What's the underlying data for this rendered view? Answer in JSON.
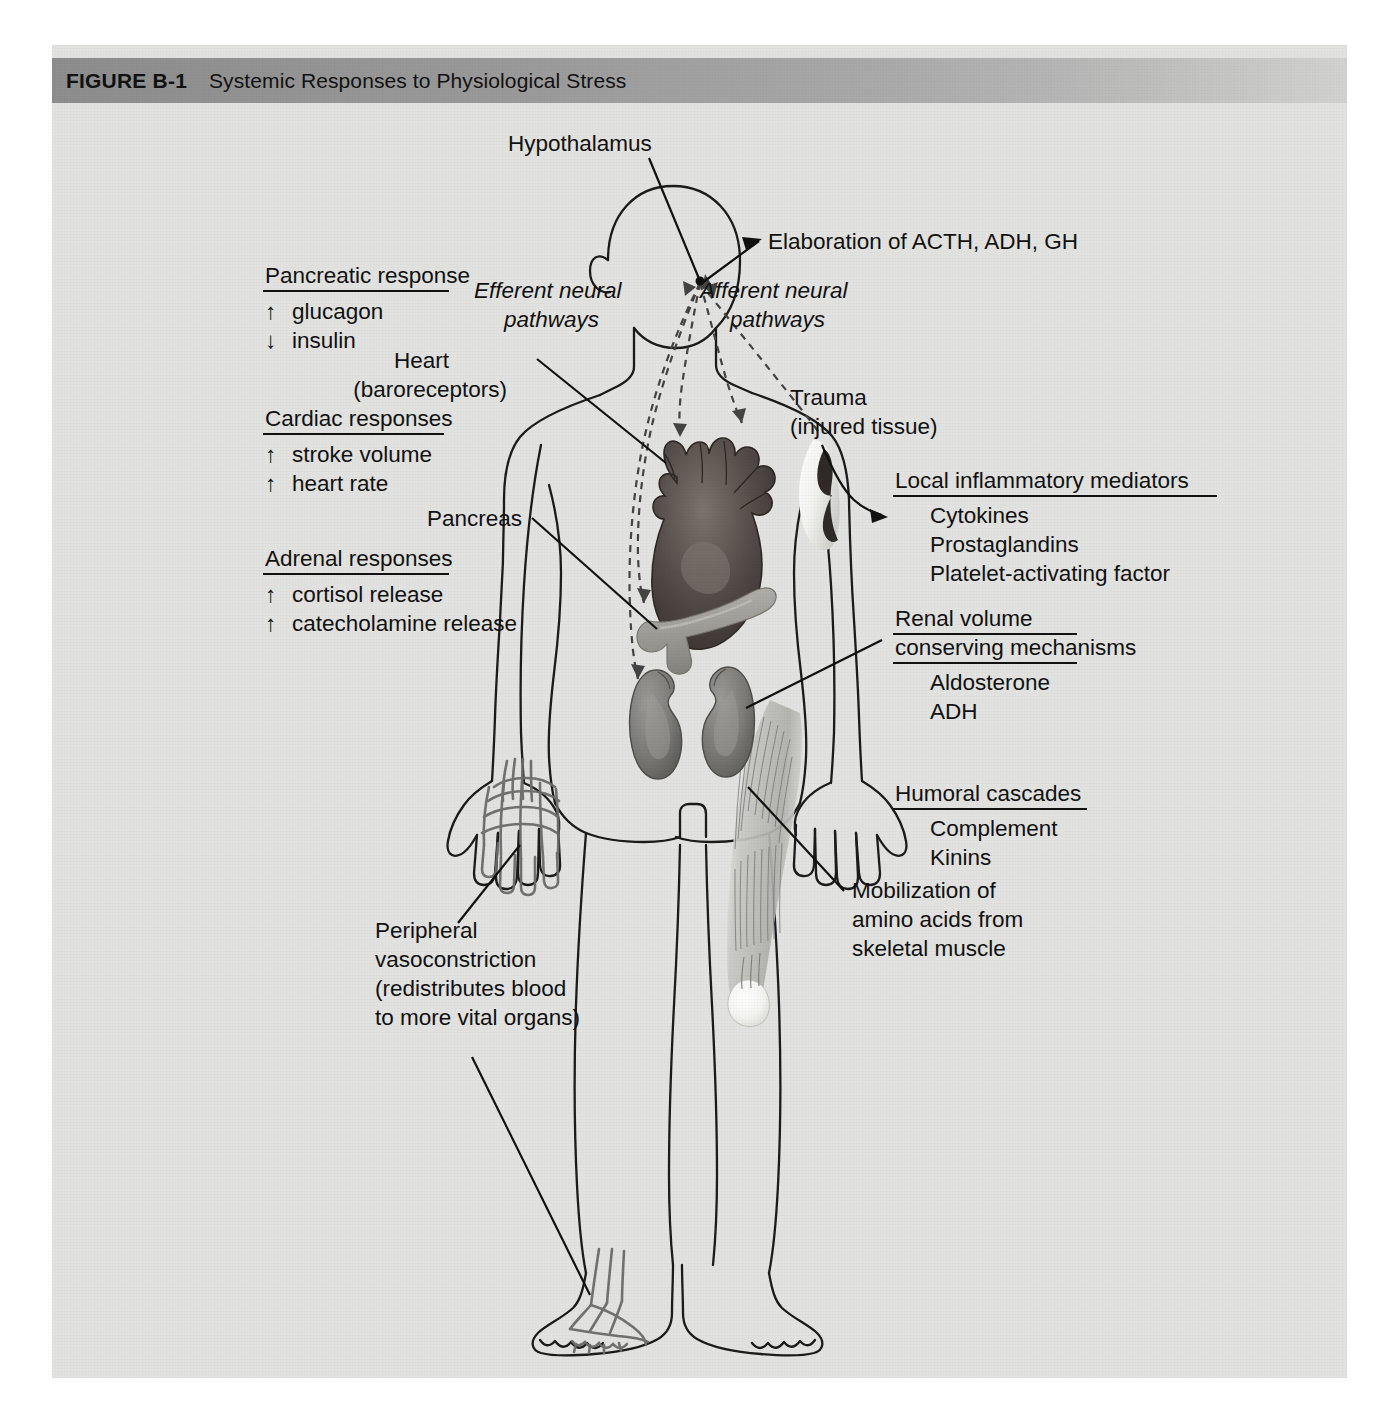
{
  "figure": {
    "number": "FIGURE B-1",
    "title": "Systemic Responses to Physiological Stress",
    "panel_bg": "#e2e2e0",
    "title_bar_from": "#8d8d8d",
    "title_bar_to": "#d2d2d0"
  },
  "labels": {
    "hypothalamus": "Hypothalamus",
    "elaboration": "Elaboration of ACTH, ADH, GH",
    "efferent_1": "Efferent neural",
    "efferent_2": "pathways",
    "afferent_1": "Afferent neural",
    "afferent_2": "pathways",
    "heart_1": "Heart",
    "heart_2": "(baroreceptors)",
    "pancreas": "Pancreas",
    "trauma_1": "Trauma",
    "trauma_2": "(injured tissue)"
  },
  "left_blocks": [
    {
      "heading": "Pancreatic response",
      "items": [
        {
          "arrow": "↑",
          "text": "glucagon"
        },
        {
          "arrow": "↓",
          "text": "insulin"
        }
      ]
    },
    {
      "heading": "Cardiac responses",
      "items": [
        {
          "arrow": "↑",
          "text": "stroke volume"
        },
        {
          "arrow": "↑",
          "text": "heart rate"
        }
      ]
    },
    {
      "heading": "Adrenal responses",
      "items": [
        {
          "arrow": "↑",
          "text": "cortisol release"
        },
        {
          "arrow": "↑",
          "text": "catecholamine release"
        }
      ]
    }
  ],
  "right_blocks": [
    {
      "heading_lines": [
        "Local inflammatory mediators"
      ],
      "items": [
        "Cytokines",
        "Prostaglandins",
        "Platelet-activating factor"
      ]
    },
    {
      "heading_lines": [
        "Renal volume",
        "conserving mechanisms"
      ],
      "items": [
        "Aldosterone",
        "ADH"
      ]
    },
    {
      "heading_lines": [
        "Humoral cascades"
      ],
      "items": [
        "Complement",
        "Kinins"
      ]
    }
  ],
  "callouts": {
    "peripheral": [
      "Peripheral",
      "vasoconstriction",
      "(redistributes blood",
      "to more vital organs)"
    ],
    "mobilization": [
      "Mobilization of",
      "amino acids from",
      "skeletal muscle"
    ]
  },
  "organs": {
    "heart": {
      "name": "heart",
      "color": "#4a4441"
    },
    "pancreas": {
      "name": "pancreas",
      "color": "#9d9d98"
    },
    "kidney_left": {
      "name": "kidney",
      "color": "#7a7773"
    },
    "kidney_right": {
      "name": "kidney",
      "color": "#7a7773"
    },
    "thigh_muscle": {
      "name": "skeletal-muscle",
      "color": "#b9b9b4"
    },
    "hand_vessels": {
      "name": "vascular-network",
      "color": "#6c6c6c"
    },
    "foot_vessels": {
      "name": "vascular-network",
      "color": "#6c6c6c"
    }
  }
}
